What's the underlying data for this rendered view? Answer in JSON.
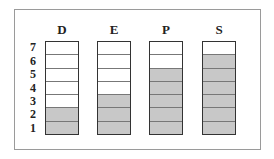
{
  "chart_data": {
    "type": "bar",
    "title": "",
    "categories": [
      "D",
      "E",
      "P",
      "S"
    ],
    "values": [
      2,
      3,
      5,
      6
    ],
    "max_cells": 7,
    "row_labels": [
      "1",
      "2",
      "3",
      "4",
      "5",
      "6",
      "7"
    ],
    "xlabel": "",
    "ylabel": "",
    "ylim": [
      0,
      7
    ],
    "colors": {
      "filled": "#c8c8c8",
      "empty": "#ffffff",
      "border": "#333333"
    }
  },
  "columns": [
    {
      "label": "D",
      "filled": 2
    },
    {
      "label": "E",
      "filled": 3
    },
    {
      "label": "P",
      "filled": 5
    },
    {
      "label": "S",
      "filled": 6
    }
  ],
  "rows": [
    "1",
    "2",
    "3",
    "4",
    "5",
    "6",
    "7"
  ]
}
